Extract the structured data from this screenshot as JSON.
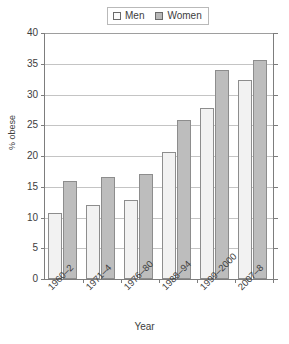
{
  "chart_data": {
    "type": "bar",
    "title": "",
    "xlabel": "Year",
    "ylabel": "% obese",
    "ylim": [
      0,
      40
    ],
    "yticks": [
      0,
      5,
      10,
      15,
      20,
      25,
      30,
      35,
      40
    ],
    "grid": true,
    "legend_position": "top-center",
    "categories": [
      "1960–2",
      "1971–4",
      "1976–80",
      "1988–94",
      "1999–2000",
      "2007–8"
    ],
    "series": [
      {
        "name": "Men",
        "color": "#f2f2f2",
        "values": [
          10.7,
          12.1,
          12.8,
          20.6,
          27.8,
          32.3
        ]
      },
      {
        "name": "Women",
        "color": "#bdbdbd",
        "values": [
          15.9,
          16.6,
          17.1,
          25.9,
          34.0,
          35.6
        ]
      }
    ]
  },
  "legend": {
    "entries": [
      {
        "label": "Men"
      },
      {
        "label": "Women"
      }
    ]
  },
  "axes": {
    "y_title": "% obese",
    "x_title": "Year",
    "y_tick_labels": [
      "0",
      "5",
      "10",
      "15",
      "20",
      "25",
      "30",
      "35",
      "40"
    ],
    "x_tick_labels": [
      "1960–2",
      "1971–4",
      "1976–80",
      "1988–94",
      "1999–2000",
      "2007–8"
    ]
  },
  "colors": {
    "men_fill": "#f2f2f2",
    "women_fill": "#bdbdbd",
    "bar_stroke": "#8d8d8d",
    "axis": "#7d7d7d",
    "grid": "#c4c4c4",
    "text": "#3d3d3d"
  }
}
